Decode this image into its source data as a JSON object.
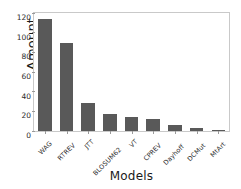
{
  "chart_data": {
    "type": "bar",
    "title": "",
    "xlabel": "Models",
    "ylabel": "Amount",
    "categories": [
      "WAG",
      "RTREV",
      "JTT",
      "BLOSUM62",
      "VT",
      "CPREV",
      "Dayhoff",
      "DCMut",
      "MtArt"
    ],
    "values": [
      114,
      90,
      28,
      17,
      14,
      12,
      6,
      3,
      1
    ],
    "ylim": [
      0,
      120
    ],
    "yticks": [
      0,
      20,
      40,
      60,
      80,
      100,
      120
    ],
    "ytick_labels": [
      "0",
      "20",
      "40",
      "60",
      "80",
      "100",
      "120"
    ],
    "grid": false,
    "legend": null,
    "bar_color": "#595959",
    "axis_color": "#c9c9c9",
    "tick_label_color": "#2b2b2b",
    "xtick_rotation": -45
  }
}
